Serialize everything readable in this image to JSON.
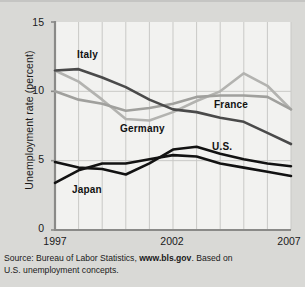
{
  "figure": {
    "background_color": "#d9d9d6",
    "plot_background_color": "#f2f2f0",
    "gridline_color": "#c9c9c6",
    "axis_color": "#8a8a88"
  },
  "source_note": {
    "prefix": "Source: Bureau of Labor Statistics, ",
    "url": "www.bls.gov",
    "suffix": ". Based on",
    "line2": "U.S. unemployment concepts."
  },
  "labels": {
    "italy": "Italy",
    "germany": "Germany",
    "france": "France",
    "us": "U.S.",
    "japan": "Japan"
  },
  "chart_data": {
    "type": "line",
    "title": "",
    "xlabel": "",
    "ylabel": "Unemployment rate (percent)",
    "xlim": [
      1997,
      2007
    ],
    "ylim": [
      0,
      15
    ],
    "yticks": [
      0,
      5,
      10,
      15
    ],
    "ytick_labels": [
      "0",
      "5",
      "10",
      "15"
    ],
    "xticks": [
      1997,
      2002,
      2007
    ],
    "xtick_labels": [
      "1997",
      "2002",
      "2007"
    ],
    "x": [
      1997,
      1998,
      1999,
      2000,
      2001,
      2002,
      2003,
      2004,
      2005,
      2006,
      2007
    ],
    "grid": "vertical-yearly-plus-horizontal-at-ticks",
    "legend": "inline-series-labels",
    "series": [
      {
        "name": "Italy",
        "color": "#4a4a4a",
        "width": 2.6,
        "values": [
          11.5,
          11.6,
          11.0,
          10.3,
          9.4,
          8.7,
          8.5,
          8.1,
          7.8,
          7.0,
          6.2
        ]
      },
      {
        "name": "Germany",
        "color": "#b3b3b0",
        "width": 2.6,
        "values": [
          11.5,
          10.7,
          9.4,
          8.0,
          7.9,
          8.5,
          9.3,
          10.0,
          11.3,
          10.4,
          8.7
        ]
      },
      {
        "name": "France",
        "color": "#a0a09d",
        "width": 2.6,
        "values": [
          10.0,
          9.4,
          9.1,
          8.6,
          8.8,
          9.1,
          9.6,
          9.7,
          9.7,
          9.6,
          8.7
        ]
      },
      {
        "name": "U.S.",
        "color": "#121212",
        "width": 2.6,
        "values": [
          4.9,
          4.5,
          4.4,
          4.0,
          4.8,
          5.8,
          6.0,
          5.5,
          5.1,
          4.8,
          4.6
        ]
      },
      {
        "name": "Japan",
        "color": "#121212",
        "width": 2.6,
        "values": [
          3.4,
          4.3,
          4.8,
          4.8,
          5.1,
          5.4,
          5.3,
          4.8,
          4.5,
          4.2,
          3.9
        ]
      }
    ]
  }
}
